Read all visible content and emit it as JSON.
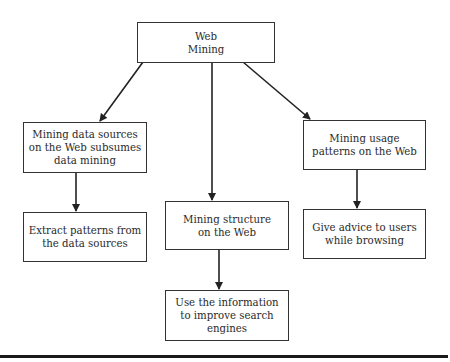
{
  "diagram": {
    "nodes": [
      {
        "id": "web-mining",
        "label": "Web\nMining"
      },
      {
        "id": "mining-data-sources",
        "label": "Mining data sources\non the Web subsumes\ndata mining"
      },
      {
        "id": "mining-structure",
        "label": "Mining structure\non the Web"
      },
      {
        "id": "mining-usage",
        "label": "Mining usage\npatterns on the Web"
      },
      {
        "id": "extract-patterns",
        "label": "Extract patterns from\nthe data sources"
      },
      {
        "id": "improve-search",
        "label": "Use the information\nto improve search\nengines"
      },
      {
        "id": "give-advice",
        "label": "Give advice to users\nwhile browsing"
      }
    ],
    "edges": [
      {
        "from": "web-mining",
        "to": "mining-data-sources"
      },
      {
        "from": "web-mining",
        "to": "mining-structure"
      },
      {
        "from": "web-mining",
        "to": "mining-usage"
      },
      {
        "from": "mining-data-sources",
        "to": "extract-patterns"
      },
      {
        "from": "mining-structure",
        "to": "improve-search"
      },
      {
        "from": "mining-usage",
        "to": "give-advice"
      }
    ]
  }
}
